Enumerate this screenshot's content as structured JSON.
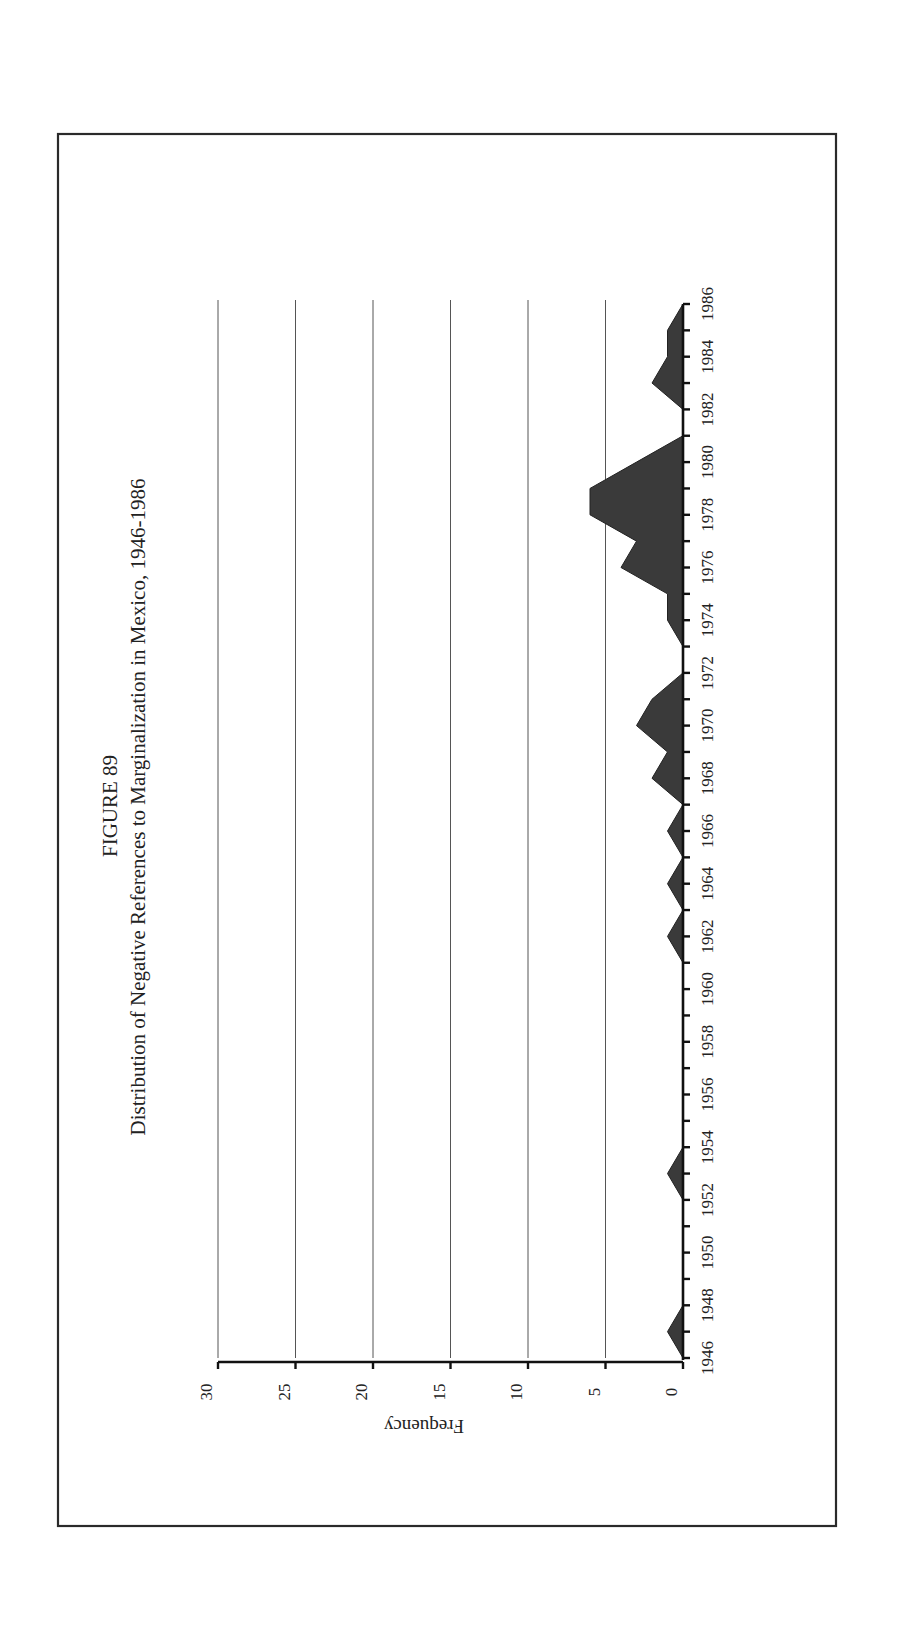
{
  "figure": {
    "label": "FIGURE 89",
    "title": "Distribution of Negative References to Marginalization in Mexico, 1946-1986",
    "y_axis_label": "Frequency"
  },
  "chart_data": {
    "type": "area",
    "xlabel": "",
    "ylabel": "Frequency",
    "orientation": "rotated 90° clockwise on page (years run vertically, frequency horizontally)",
    "ylim": [
      0,
      30
    ],
    "yticks": [
      0,
      5,
      10,
      15,
      20,
      25,
      30
    ],
    "xticks_labeled": [
      1946,
      1948,
      1950,
      1952,
      1954,
      1956,
      1958,
      1960,
      1962,
      1964,
      1966,
      1968,
      1970,
      1972,
      1974,
      1976,
      1978,
      1980,
      1982,
      1984,
      1986
    ],
    "grid": true,
    "legend": null,
    "x": [
      1946,
      1947,
      1948,
      1949,
      1950,
      1951,
      1952,
      1953,
      1954,
      1955,
      1956,
      1957,
      1958,
      1959,
      1960,
      1961,
      1962,
      1963,
      1964,
      1965,
      1966,
      1967,
      1968,
      1969,
      1970,
      1971,
      1972,
      1973,
      1974,
      1975,
      1976,
      1977,
      1978,
      1979,
      1980,
      1981,
      1982,
      1983,
      1984,
      1985,
      1986
    ],
    "values": [
      0,
      1,
      0,
      0,
      0,
      0,
      0,
      1,
      0,
      0,
      0,
      0,
      0,
      0,
      0,
      0,
      1,
      0,
      1,
      0,
      1,
      0,
      2,
      1,
      3,
      2,
      0,
      0,
      1,
      1,
      4,
      3,
      6,
      6,
      3,
      0,
      0,
      2,
      1,
      1,
      0
    ],
    "fill_color": "#3a3a3a"
  }
}
